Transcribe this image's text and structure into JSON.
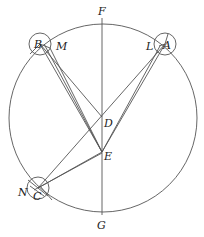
{
  "diagram": {
    "type": "geometric-construction",
    "stroke_color": "#555555",
    "label_color": "#222222",
    "big_circle": {
      "cx": 103,
      "cy": 118,
      "r": 94
    },
    "axis_line": {
      "label_top": "F",
      "label_bottom": "G",
      "x": 102,
      "y1": 18,
      "y2": 215
    },
    "small_circles": [
      {
        "name": "B",
        "cx": 40,
        "cy": 44,
        "r": 11
      },
      {
        "name": "A",
        "cx": 165,
        "cy": 44,
        "r": 11
      },
      {
        "name": "C",
        "cx": 38,
        "cy": 188,
        "r": 11
      }
    ],
    "points": {
      "A": {
        "x": 165,
        "y": 44
      },
      "B": {
        "x": 40,
        "y": 44
      },
      "C": {
        "x": 38,
        "y": 188
      },
      "D": {
        "x": 102,
        "y": 117
      },
      "E": {
        "x": 102,
        "y": 152
      },
      "F": {
        "x": 102,
        "y": 22
      },
      "G": {
        "x": 102,
        "y": 214
      },
      "L": {
        "x": 159,
        "y": 46
      },
      "M": {
        "x": 50,
        "y": 48
      },
      "N": {
        "x": 31,
        "y": 188
      }
    },
    "labels": {
      "A": "A",
      "B": "B",
      "C": "C",
      "D": "D",
      "E": "E",
      "F": "F",
      "G": "G",
      "L": "L",
      "M": "M",
      "N": "N"
    }
  }
}
